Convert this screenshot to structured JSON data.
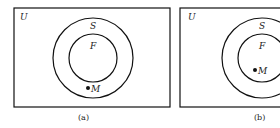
{
  "panels": [
    {
      "id": "a",
      "caption": "(a)",
      "universe_label": "U",
      "outer_set_label": "S",
      "inner_set_label": "F",
      "point_label": "M",
      "point_location": "between F and S (inside S, outside F)"
    },
    {
      "id": "b",
      "caption": "(b)",
      "universe_label": "U",
      "outer_set_label": "S",
      "inner_set_label": "F",
      "point_label": "M",
      "point_location": "inside F"
    }
  ],
  "colors": {
    "stroke": "#111111",
    "background": "#ffffff"
  }
}
